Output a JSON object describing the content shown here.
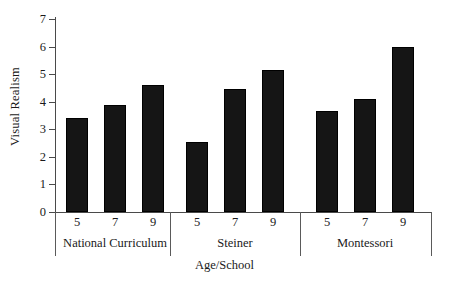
{
  "chart_data": {
    "type": "bar",
    "title": "",
    "xlabel": "Age/School",
    "ylabel": "Visual Realism",
    "ylim": [
      0,
      7
    ],
    "yticks": [
      0,
      1,
      2,
      3,
      4,
      5,
      6,
      7
    ],
    "grid": false,
    "legend": null,
    "categories": [
      "5",
      "7",
      "9",
      "5",
      "7",
      "9",
      "5",
      "7",
      "9"
    ],
    "groups": [
      {
        "name": "National Curriculum",
        "categories": [
          "5",
          "7",
          "9"
        ],
        "values": [
          3.4,
          3.88,
          4.6
        ]
      },
      {
        "name": "Steiner",
        "categories": [
          "5",
          "7",
          "9"
        ],
        "values": [
          2.55,
          4.45,
          5.15
        ]
      },
      {
        "name": "Montessori",
        "categories": [
          "5",
          "7",
          "9"
        ],
        "values": [
          3.65,
          4.1,
          6.0
        ]
      }
    ],
    "values": [
      3.4,
      3.88,
      4.6,
      2.55,
      4.45,
      5.15,
      3.65,
      4.1,
      6.0
    ],
    "bar_color": "#151515"
  },
  "axis": {
    "y_title": "Visual Realism",
    "x_title": "Age/School",
    "y_tick_labels": [
      "0",
      "1",
      "2",
      "3",
      "4",
      "5",
      "6",
      "7"
    ]
  }
}
